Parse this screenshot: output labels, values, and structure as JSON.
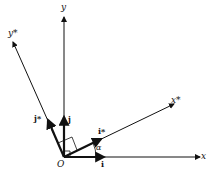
{
  "diagram": {
    "axes": {
      "y": "y",
      "y_star": "y*",
      "x": "x",
      "x_star": "x*"
    },
    "vectors": {
      "j": "j",
      "j_star": "j*",
      "i": "i",
      "i_star": "i*"
    },
    "origin": "O",
    "angle": "α"
  }
}
